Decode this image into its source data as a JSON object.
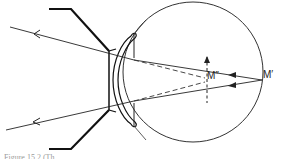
{
  "figure": {
    "labels": {
      "far_point": "M′",
      "image_point": "M″"
    },
    "caption": "Figure 15.2 (Th..."
  },
  "colors": {
    "line": "#222222",
    "background": "#ffffff"
  }
}
